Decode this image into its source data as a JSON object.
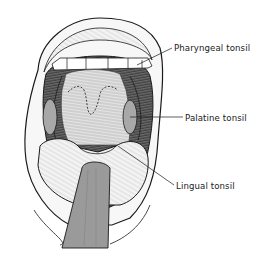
{
  "diagram": {
    "labels": [
      {
        "id": "pharyngeal",
        "text": "Pharyngeal tonsil"
      },
      {
        "id": "palatine",
        "text": "Palatine tonsil"
      },
      {
        "id": "lingual",
        "text": "Lingual tonsil"
      }
    ],
    "colors": {
      "background": "#ffffff",
      "ink": "#1a1a1a",
      "tongue_depressor": "#9a9a9a",
      "throat_shading": "#c8c8c8",
      "dark_cavity": "#4a4a4a"
    }
  }
}
